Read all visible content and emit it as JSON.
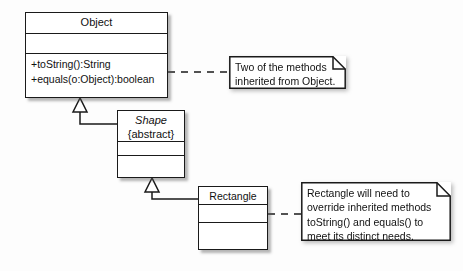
{
  "diagram": {
    "background_color": "#fdfdfd",
    "line_color": "#1a1a1a",
    "fill_color": "#ffffff",
    "classes": [
      {
        "id": "object",
        "name": "Object",
        "abstract": false,
        "stereotype": "",
        "attributes": [],
        "operations": [
          "+toString():String",
          "+equals(o:Object):boolean"
        ]
      },
      {
        "id": "shape",
        "name": "Shape",
        "abstract": true,
        "stereotype": "{abstract}",
        "attributes": [],
        "operations": []
      },
      {
        "id": "rectangle",
        "name": "Rectangle",
        "abstract": false,
        "stereotype": "",
        "attributes": [],
        "operations": []
      }
    ],
    "notes": [
      {
        "id": "note-object-methods",
        "text": "Two of the methods\ninherited from Object.",
        "attached_to": "object"
      },
      {
        "id": "note-rectangle-override",
        "text": "Rectangle will need to\noverride inherited methods\ntoString() and equals() to\nmeet its distinct needs.",
        "attached_to": "rectangle"
      }
    ],
    "relationships": [
      {
        "id": "gen-shape-object",
        "type": "generalization",
        "from": "shape",
        "to": "object",
        "label": ""
      },
      {
        "id": "gen-rectangle-shape",
        "type": "generalization",
        "from": "rectangle",
        "to": "shape",
        "label": ""
      },
      {
        "id": "anchor-object-note",
        "type": "note-anchor",
        "from": "object",
        "to": "note-object-methods",
        "label": ""
      },
      {
        "id": "anchor-rectangle-note",
        "type": "note-anchor",
        "from": "rectangle",
        "to": "note-rectangle-override",
        "label": ""
      }
    ]
  }
}
